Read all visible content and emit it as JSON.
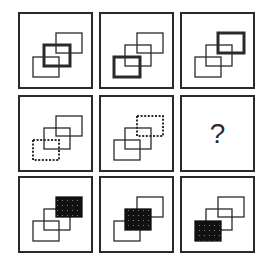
{
  "puzzle": {
    "rows": 3,
    "cols": 3,
    "missing_label": "?",
    "colors": {
      "stroke": "#2a2a2a",
      "fill": "#111111",
      "dots": "#8a8a8a"
    },
    "rect_positions": {
      "top-right": {
        "x": 36,
        "y": 19,
        "w": 26,
        "h": 20
      },
      "middle": {
        "x": 24,
        "y": 31,
        "w": 26,
        "h": 21
      },
      "bottom-left": {
        "x": 13,
        "y": 43,
        "w": 26,
        "h": 20
      }
    },
    "cells": [
      {
        "row": 1,
        "col": 1,
        "style": "bold",
        "target": "middle"
      },
      {
        "row": 1,
        "col": 2,
        "style": "bold",
        "target": "bottom-left"
      },
      {
        "row": 1,
        "col": 3,
        "style": "bold",
        "target": "top-right"
      },
      {
        "row": 2,
        "col": 1,
        "style": "dotted",
        "target": "bottom-left"
      },
      {
        "row": 2,
        "col": 2,
        "style": "dotted",
        "target": "top-right"
      },
      {
        "row": 2,
        "col": 3,
        "style": "missing",
        "target": null
      },
      {
        "row": 3,
        "col": 1,
        "style": "filled",
        "target": "top-right"
      },
      {
        "row": 3,
        "col": 2,
        "style": "filled",
        "target": "middle"
      },
      {
        "row": 3,
        "col": 3,
        "style": "filled",
        "target": "bottom-left"
      }
    ]
  }
}
